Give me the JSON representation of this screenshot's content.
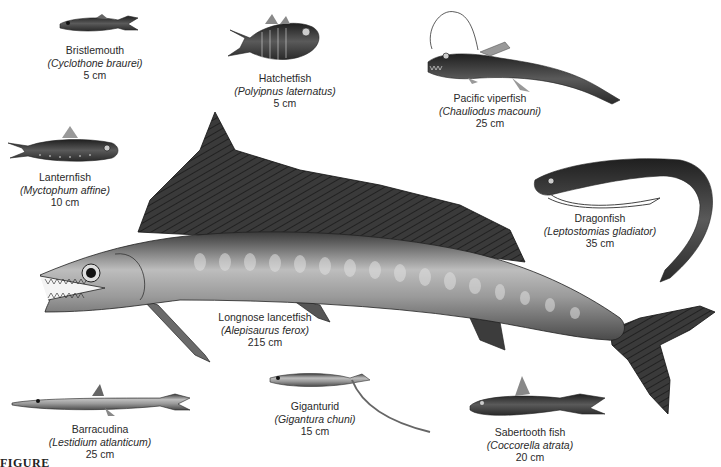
{
  "figure": {
    "caption_fragment": "FIGURE",
    "style": "grayscale scientific illustration",
    "colors": {
      "background": "#ffffff",
      "text": "#2a2a2a",
      "fish_dark": "#2b2b2b",
      "fish_mid": "#6f6f6f",
      "fish_light": "#c9c9c9"
    }
  },
  "fishes": [
    {
      "id": "bristlemouth",
      "common": "Bristlemouth",
      "scientific": "(Cyclothone braurei)",
      "size": "5 cm"
    },
    {
      "id": "hatchetfish",
      "common": "Hatchetfish",
      "scientific": "(Polyipnus laternatus)",
      "size": "5 cm"
    },
    {
      "id": "pacific-viperfish",
      "common": "Pacific viperfish",
      "scientific": "(Chauliodus macouni)",
      "size": "25 cm"
    },
    {
      "id": "lanternfish",
      "common": "Lanternfish",
      "scientific": "(Myctophum affine)",
      "size": "10 cm"
    },
    {
      "id": "dragonfish",
      "common": "Dragonfish",
      "scientific": "(Leptostomias gladiator)",
      "size": "35 cm"
    },
    {
      "id": "longnose-lancetfish",
      "common": "Longnose lancetfish",
      "scientific": "(Alepisaurus ferox)",
      "size": "215 cm"
    },
    {
      "id": "barracudina",
      "common": "Barracudina",
      "scientific": "(Lestidium atlanticum)",
      "size": "25 cm"
    },
    {
      "id": "giganturid",
      "common": "Giganturid",
      "scientific": "(Gigantura chuni)",
      "size": "15 cm"
    },
    {
      "id": "sabertooth-fish",
      "common": "Sabertooth fish",
      "scientific": "(Coccorella atrata)",
      "size": "20 cm"
    }
  ]
}
